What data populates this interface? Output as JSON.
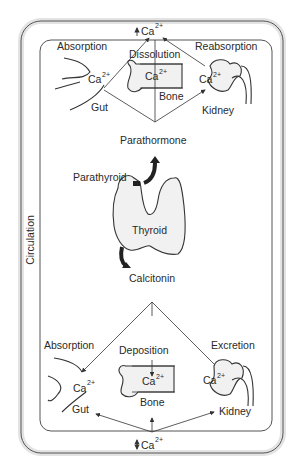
{
  "diagram": {
    "type": "calcium homeostasis diagram",
    "circulation_label": "Circulation",
    "top": {
      "hormone": "Parathormone",
      "ca_top": "Ca",
      "ca_top_sup": "2+",
      "gut": {
        "process": "Absorption",
        "ion": "Ca",
        "ion_sup": "2+",
        "organ": "Gut"
      },
      "bone": {
        "process": "Dissolution",
        "ion": "Ca",
        "ion_sup": "2+",
        "organ": "Bone"
      },
      "kidney": {
        "process": "Reabsorption",
        "ion": "Ca",
        "ion_sup": "2+",
        "organ": "Kidney"
      }
    },
    "center": {
      "parathyroid": "Parathyroid",
      "thyroid": "Thyroid",
      "upper_hormone": "Parathormone",
      "lower_hormone": "Calcitonin"
    },
    "bottom": {
      "hormone": "Calcitonin",
      "ca_bottom": "Ca",
      "ca_bottom_sup": "2+",
      "gut": {
        "process": "Absorption",
        "ion": "Ca",
        "ion_sup": "2+",
        "organ": "Gut"
      },
      "bone": {
        "process": "Deposition",
        "ion": "Ca",
        "ion_sup": "2+",
        "organ": "Bone"
      },
      "kidney": {
        "process": "Excretion",
        "ion": "Ca",
        "ion_sup": "2+",
        "organ": "Kidney"
      }
    },
    "colors": {
      "line": "#333333",
      "organ_fill": "#f1f1f1",
      "arrow_fill": "#2a2a2a",
      "frame_shadow": "#dcdcdc"
    }
  }
}
